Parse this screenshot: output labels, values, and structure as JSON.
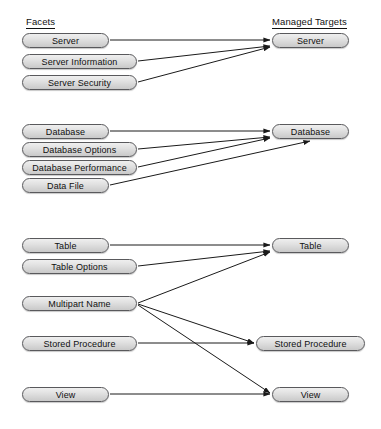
{
  "diagram": {
    "type": "mapping-diagram",
    "canvas": {
      "width": 381,
      "height": 429
    },
    "style": {
      "node_fill_top": "#efefef",
      "node_fill_bottom": "#c9c9c9",
      "node_border": "#59595c",
      "edge_color": "#1a1a1a",
      "text_color": "#101010",
      "background": "#ffffff"
    },
    "headings": {
      "left": "Facets",
      "right": "Managed Targets"
    },
    "left_nodes": [
      {
        "id": "f-server",
        "label": "Server",
        "x": 22,
        "y": 33,
        "w": 87,
        "h": 15
      },
      {
        "id": "f-server-information",
        "label": "Server Information",
        "x": 22,
        "y": 54,
        "w": 115,
        "h": 15
      },
      {
        "id": "f-server-security",
        "label": "Server Security",
        "x": 22,
        "y": 75,
        "w": 115,
        "h": 15
      },
      {
        "id": "f-database",
        "label": "Database",
        "x": 22,
        "y": 124,
        "w": 87,
        "h": 15
      },
      {
        "id": "f-database-options",
        "label": "Database Options",
        "x": 22,
        "y": 142,
        "w": 115,
        "h": 15
      },
      {
        "id": "f-database-performance",
        "label": "Database Performance",
        "x": 22,
        "y": 160,
        "w": 115,
        "h": 15
      },
      {
        "id": "f-data-file",
        "label": "Data File",
        "x": 22,
        "y": 178,
        "w": 87,
        "h": 15
      },
      {
        "id": "f-table",
        "label": "Table",
        "x": 22,
        "y": 238,
        "w": 87,
        "h": 15
      },
      {
        "id": "f-table-options",
        "label": "Table Options",
        "x": 22,
        "y": 259,
        "w": 115,
        "h": 15
      },
      {
        "id": "f-multipart-name",
        "label": "Multipart Name",
        "x": 22,
        "y": 296,
        "w": 115,
        "h": 15
      },
      {
        "id": "f-stored-procedure",
        "label": "Stored Procedure",
        "x": 22,
        "y": 336,
        "w": 115,
        "h": 15
      },
      {
        "id": "f-view",
        "label": "View",
        "x": 22,
        "y": 387,
        "w": 87,
        "h": 15
      }
    ],
    "right_nodes": [
      {
        "id": "t-server",
        "label": "Server",
        "x": 272,
        "y": 33,
        "w": 77,
        "h": 15
      },
      {
        "id": "t-database",
        "label": "Database",
        "x": 272,
        "y": 124,
        "w": 77,
        "h": 15
      },
      {
        "id": "t-table",
        "label": "Table",
        "x": 272,
        "y": 238,
        "w": 77,
        "h": 15
      },
      {
        "id": "t-stored-procedure",
        "label": "Stored Procedure",
        "x": 256,
        "y": 336,
        "w": 109,
        "h": 15
      },
      {
        "id": "t-view",
        "label": "View",
        "x": 272,
        "y": 387,
        "w": 77,
        "h": 15
      }
    ],
    "edges": [
      {
        "from": "f-server",
        "to": "t-server",
        "x1": 110,
        "y1": 40,
        "x2": 270,
        "y2": 40
      },
      {
        "from": "f-server-information",
        "to": "t-server",
        "x1": 138,
        "y1": 61,
        "x2": 270,
        "y2": 46
      },
      {
        "from": "f-server-security",
        "to": "t-server",
        "x1": 138,
        "y1": 82,
        "x2": 270,
        "y2": 47
      },
      {
        "from": "f-database",
        "to": "t-database",
        "x1": 110,
        "y1": 131,
        "x2": 270,
        "y2": 131
      },
      {
        "from": "f-database-options",
        "to": "t-database",
        "x1": 138,
        "y1": 149,
        "x2": 270,
        "y2": 137
      },
      {
        "from": "f-database-performance",
        "to": "t-database",
        "x1": 138,
        "y1": 167,
        "x2": 270,
        "y2": 138
      },
      {
        "from": "f-data-file",
        "to": "t-database",
        "x1": 110,
        "y1": 185,
        "x2": 310,
        "y2": 141
      },
      {
        "from": "f-table",
        "to": "t-table",
        "x1": 110,
        "y1": 245,
        "x2": 270,
        "y2": 245
      },
      {
        "from": "f-table-options",
        "to": "t-table",
        "x1": 138,
        "y1": 266,
        "x2": 270,
        "y2": 251
      },
      {
        "from": "f-multipart-name",
        "to": "t-table",
        "x1": 138,
        "y1": 303,
        "x2": 270,
        "y2": 252
      },
      {
        "from": "f-multipart-name",
        "to": "t-stored-procedure",
        "x1": 138,
        "y1": 304,
        "x2": 254,
        "y2": 343
      },
      {
        "from": "f-multipart-name",
        "to": "t-view",
        "x1": 138,
        "y1": 305,
        "x2": 270,
        "y2": 393
      },
      {
        "from": "f-stored-procedure",
        "to": "t-stored-procedure",
        "x1": 138,
        "y1": 343,
        "x2": 254,
        "y2": 343
      },
      {
        "from": "f-view",
        "to": "t-view",
        "x1": 110,
        "y1": 394,
        "x2": 270,
        "y2": 394
      }
    ]
  }
}
